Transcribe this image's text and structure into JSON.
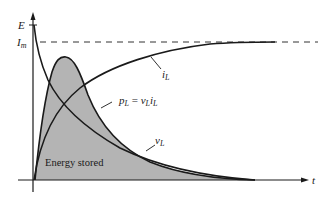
{
  "diagram": {
    "axes": {
      "y_label": "E",
      "y_level_label": "I",
      "y_level_subscript": "m",
      "x_label": "t"
    },
    "curves": {
      "current": {
        "name": "i",
        "subscript": "L"
      },
      "voltage": {
        "name": "v",
        "subscript": "L"
      },
      "power": {
        "name": "p",
        "subscript": "L",
        "equals": " = ",
        "term1": "v",
        "term1_sub": "L",
        "term2": "i",
        "term2_sub": "L"
      }
    },
    "area_label": "Energy stored",
    "colors": {
      "shade": "#b4b4b4",
      "line": "#1a1a1a",
      "background": "#ffffff"
    }
  }
}
